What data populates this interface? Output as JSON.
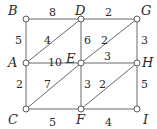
{
  "diagram": {
    "type": "weighted-graph",
    "nodes": [
      {
        "id": "B",
        "label": "B",
        "x": 26,
        "y": 19,
        "lx": 8,
        "ly": 15
      },
      {
        "id": "D",
        "label": "D",
        "x": 81,
        "y": 19,
        "lx": 75,
        "ly": 15
      },
      {
        "id": "G",
        "label": "G",
        "x": 137,
        "y": 19,
        "lx": 141,
        "ly": 15
      },
      {
        "id": "A",
        "label": "A",
        "x": 26,
        "y": 63,
        "lx": 8,
        "ly": 67
      },
      {
        "id": "E",
        "label": "E",
        "x": 81,
        "y": 63,
        "lx": 66,
        "ly": 63
      },
      {
        "id": "H",
        "label": "H",
        "x": 137,
        "y": 63,
        "lx": 142,
        "ly": 67
      },
      {
        "id": "C",
        "label": "C",
        "x": 26,
        "y": 109,
        "lx": 8,
        "ly": 124
      },
      {
        "id": "F",
        "label": "F",
        "x": 81,
        "y": 109,
        "lx": 76,
        "ly": 124
      },
      {
        "id": "I",
        "label": "I",
        "x": 137,
        "y": 109,
        "lx": 143,
        "ly": 124
      }
    ],
    "edges": [
      {
        "from": "B",
        "to": "D",
        "weight": "8",
        "wx": 49,
        "wy": 16
      },
      {
        "from": "D",
        "to": "G",
        "weight": "2",
        "wx": 105,
        "wy": 16
      },
      {
        "from": "B",
        "to": "A",
        "weight": "5",
        "wx": 15,
        "wy": 44
      },
      {
        "from": "A",
        "to": "D",
        "weight": "4",
        "wx": 44,
        "wy": 44
      },
      {
        "from": "D",
        "to": "E",
        "weight": "6",
        "wx": 84,
        "wy": 44
      },
      {
        "from": "E",
        "to": "G",
        "weight": "2",
        "wx": 101,
        "wy": 44
      },
      {
        "from": "G",
        "to": "H",
        "weight": "3",
        "wx": 141,
        "wy": 44
      },
      {
        "from": "A",
        "to": "E",
        "weight": "10",
        "wx": 48,
        "wy": 66
      },
      {
        "from": "E",
        "to": "H",
        "weight": "3",
        "wx": 104,
        "wy": 60
      },
      {
        "from": "A",
        "to": "C",
        "weight": "2",
        "wx": 16,
        "wy": 88
      },
      {
        "from": "C",
        "to": "E",
        "weight": "7",
        "wx": 44,
        "wy": 88
      },
      {
        "from": "E",
        "to": "F",
        "weight": "3",
        "wx": 84,
        "wy": 88
      },
      {
        "from": "F",
        "to": "H",
        "weight": "2",
        "wx": 99,
        "wy": 88
      },
      {
        "from": "H",
        "to": "I",
        "weight": "5",
        "wx": 141,
        "wy": 88
      },
      {
        "from": "C",
        "to": "F",
        "weight": "5",
        "wx": 49,
        "wy": 126
      },
      {
        "from": "F",
        "to": "I",
        "weight": "4",
        "wx": 105,
        "wy": 126
      }
    ]
  }
}
